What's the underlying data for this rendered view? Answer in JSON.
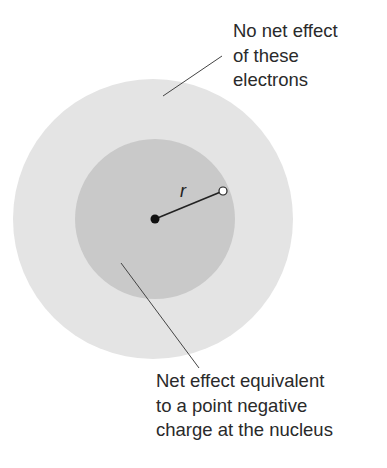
{
  "diagram": {
    "outer_shell": {
      "cx": 153,
      "cy": 219,
      "r": 140,
      "color": "#e4e4e4"
    },
    "inner_sphere": {
      "cx": 155,
      "cy": 219,
      "r": 80,
      "color": "#c9c9c9"
    },
    "nucleus": {
      "cx": 155,
      "cy": 219,
      "r": 4.5,
      "color": "#111111"
    },
    "electron_point": {
      "cx": 223,
      "cy": 191,
      "r": 4,
      "color": "#ffffff"
    },
    "radius_label": "r",
    "top_label": {
      "lines": [
        "No net effect",
        "of these",
        "electrons"
      ]
    },
    "bottom_label": {
      "lines": [
        "Net effect equivalent",
        "to a point negative",
        "charge at the nucleus"
      ]
    }
  }
}
